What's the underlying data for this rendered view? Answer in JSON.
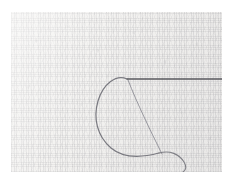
{
  "image": {
    "subject": "sewing-thread-on-woven-fabric",
    "caption": "Close-up photograph of a length of dark sewing thread forming a loop on a pale woven fabric ground",
    "medium": "scanned photograph",
    "width_px": 228,
    "height_px": 179
  },
  "canvas": {
    "paper_color": "#ffffff",
    "margin_left_px": 11,
    "margin_top_px": 12,
    "margin_right_px": 6,
    "margin_bottom_px": 7
  },
  "fabric": {
    "label": "woven fabric ground",
    "base_color": "#f2f1ef",
    "fiber_color": "#96969b",
    "weave": "plain-weave warp and weft",
    "field_left_px": 11,
    "field_top_px": 12,
    "field_width_px": 211,
    "field_height_px": 160
  },
  "thread": {
    "color": "#6a6a70",
    "highlight_color": "#8e8e96",
    "stroke_width_px": 1.1,
    "elements": [
      {
        "name": "horizontal-taut-thread",
        "description": "Dark straight thread running horizontally from the loop apex to the right edge",
        "kind": "line",
        "start": [
          127,
          79
        ],
        "end": [
          224,
          79
        ],
        "color": "#59595f",
        "stroke_width_px": 1.4
      },
      {
        "name": "thread-loop",
        "description": "Large open loop curving down and to the left from the apex then sweeping right",
        "kind": "path",
        "path": "M 127 79 C 116 74, 103 84, 98 101 C 93 118, 97 136, 111 148 C 124 159, 144 157, 159 153",
        "color": "#73737a",
        "stroke_width_px": 1.2
      },
      {
        "name": "diagonal-taut-thread",
        "description": "Thread pulled tight on a diagonal from the apex down to the crossing point",
        "kind": "path",
        "path": "M 128 80 C 137 103, 150 130, 162 154",
        "color": "#8a8a92",
        "stroke_width_px": 1.0
      },
      {
        "name": "thread-tail",
        "description": "Loose tail curving down and off to the right past the crossing point",
        "kind": "path",
        "path": "M 159 153 C 170 150, 179 154, 184 162 C 187 167, 186 170, 183 172",
        "color": "#77777e",
        "stroke_width_px": 1.1
      }
    ],
    "crossing_point": [
      161,
      154
    ],
    "apex_point": [
      127,
      79
    ]
  }
}
